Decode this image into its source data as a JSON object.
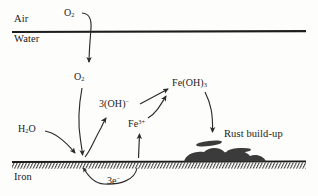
{
  "diagram": {
    "colors": {
      "ink": "#1a1a1a",
      "rust_fill": "#3b3b3b",
      "background": "#fdfdfc"
    },
    "regions": {
      "air": "Air",
      "water": "Water",
      "iron": "Iron"
    },
    "species": {
      "oxygen_air": {
        "formula": "O",
        "sub": "2"
      },
      "oxygen_water": {
        "formula": "O",
        "sub": "2"
      },
      "water_molecule": {
        "formula": "H",
        "sub": "2",
        "tail": "O"
      },
      "hydroxide": {
        "prefix": "3(OH)",
        "sup": "−"
      },
      "iron_ion": {
        "formula": "Fe",
        "sup": "3+"
      },
      "iron_hydroxide": {
        "formula": "Fe(OH)",
        "sub": "3"
      },
      "electrons": {
        "prefix": "3e",
        "sup": "−"
      }
    },
    "annotations": {
      "rust": "Rust build-up"
    },
    "flows": [
      {
        "from": "O2 (air)",
        "to": "O2 (water)",
        "style": "curved-arrow"
      },
      {
        "from": "O2 (water)",
        "to": "iron surface",
        "style": "curved-arrow"
      },
      {
        "from": "H2O",
        "to": "iron surface",
        "style": "curved-arrow"
      },
      {
        "from": "iron surface",
        "to": "3(OH)-",
        "style": "curved-arrow"
      },
      {
        "from": "3(OH)-",
        "to": "Fe(OH)3",
        "style": "straight-arrow"
      },
      {
        "from": "iron surface",
        "to": "Fe3+",
        "style": "straight-arrow"
      },
      {
        "from": "Fe3+",
        "to": "Fe(OH)3",
        "style": "curved-arrow"
      },
      {
        "from": "Fe(OH)3",
        "to": "rust build-up",
        "style": "curved-arrow"
      },
      {
        "from": "iron (3e-)",
        "to": "iron surface",
        "style": "curved-arrow-below"
      }
    ]
  }
}
